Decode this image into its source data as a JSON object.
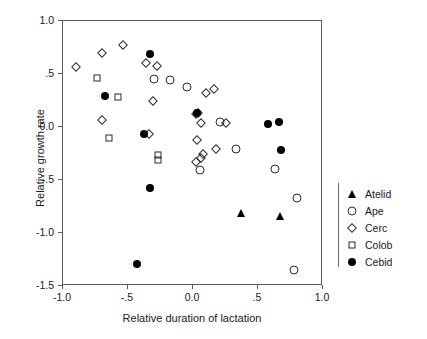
{
  "chart_data": {
    "type": "scatter",
    "title": "",
    "xlabel": "Relative duration of lactation",
    "ylabel": "Relative growth rate",
    "xlim": [
      -1.0,
      1.0
    ],
    "ylim": [
      -1.5,
      1.0
    ],
    "xticks": [
      -1.0,
      -0.5,
      0.0,
      0.5,
      1.0
    ],
    "xticklabels": [
      "-1.0",
      "-.5",
      "0.0",
      ".5",
      "1.0"
    ],
    "yticks": [
      -1.5,
      -1.0,
      -0.5,
      0.0,
      0.5,
      1.0
    ],
    "yticklabels": [
      "-1.5",
      "-1.0",
      "-.5",
      "0.0",
      ".5",
      "1.0"
    ],
    "grid": false,
    "legend_position": "right",
    "series": [
      {
        "name": "Atelid",
        "marker": "triangle-filled",
        "filled": true,
        "points": [
          {
            "x": 0.37,
            "y": -0.81
          },
          {
            "x": 0.67,
            "y": -0.84
          }
        ]
      },
      {
        "name": "Ape",
        "marker": "circle-open",
        "filled": false,
        "points": [
          {
            "x": -0.3,
            "y": 0.45
          },
          {
            "x": -0.18,
            "y": 0.44
          },
          {
            "x": -0.05,
            "y": 0.38
          },
          {
            "x": 0.21,
            "y": 0.05
          },
          {
            "x": 0.33,
            "y": -0.21
          },
          {
            "x": 0.05,
            "y": -0.41
          },
          {
            "x": 0.63,
            "y": -0.4
          },
          {
            "x": 0.8,
            "y": -0.67
          },
          {
            "x": 0.78,
            "y": -1.35
          }
        ]
      },
      {
        "name": "Cerc",
        "marker": "diamond-open",
        "filled": false,
        "points": [
          {
            "x": -0.9,
            "y": 0.57
          },
          {
            "x": -0.7,
            "y": 0.7
          },
          {
            "x": -0.54,
            "y": 0.77
          },
          {
            "x": -0.36,
            "y": 0.6
          },
          {
            "x": -0.28,
            "y": 0.58
          },
          {
            "x": -0.7,
            "y": 0.07
          },
          {
            "x": -0.31,
            "y": 0.25
          },
          {
            "x": -0.34,
            "y": -0.07
          },
          {
            "x": 0.1,
            "y": 0.32
          },
          {
            "x": 0.16,
            "y": 0.36
          },
          {
            "x": 0.04,
            "y": 0.13
          },
          {
            "x": 0.02,
            "y": 0.12
          },
          {
            "x": 0.06,
            "y": 0.04
          },
          {
            "x": 0.25,
            "y": 0.04
          },
          {
            "x": 0.03,
            "y": -0.12
          },
          {
            "x": 0.18,
            "y": -0.21
          },
          {
            "x": 0.08,
            "y": -0.25
          },
          {
            "x": 0.06,
            "y": -0.29
          },
          {
            "x": 0.02,
            "y": -0.33
          }
        ]
      },
      {
        "name": "Colob",
        "marker": "square-open",
        "filled": false,
        "points": [
          {
            "x": -0.74,
            "y": 0.46
          },
          {
            "x": -0.58,
            "y": 0.28
          },
          {
            "x": -0.65,
            "y": -0.1
          },
          {
            "x": -0.27,
            "y": -0.26
          },
          {
            "x": -0.27,
            "y": -0.31
          }
        ]
      },
      {
        "name": "Cebid",
        "marker": "circle-filled",
        "filled": true,
        "points": [
          {
            "x": -0.68,
            "y": 0.29
          },
          {
            "x": -0.33,
            "y": 0.69
          },
          {
            "x": -0.38,
            "y": -0.07
          },
          {
            "x": 0.03,
            "y": 0.13
          },
          {
            "x": 0.58,
            "y": 0.03
          },
          {
            "x": 0.66,
            "y": 0.05
          },
          {
            "x": 0.68,
            "y": -0.22
          },
          {
            "x": -0.33,
            "y": -0.58
          },
          {
            "x": -0.43,
            "y": -1.29
          }
        ]
      }
    ]
  },
  "legend": {
    "entries": [
      {
        "label": "Atelid",
        "marker": "triangle-filled"
      },
      {
        "label": "Ape",
        "marker": "circle-open"
      },
      {
        "label": "Cerc",
        "marker": "diamond-open"
      },
      {
        "label": "Colob",
        "marker": "square-open"
      },
      {
        "label": "Cebid",
        "marker": "circle-filled"
      }
    ]
  }
}
